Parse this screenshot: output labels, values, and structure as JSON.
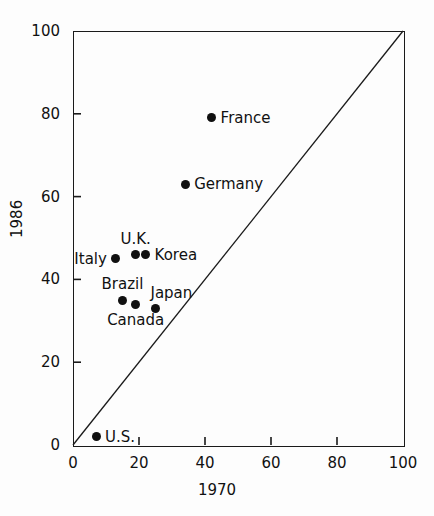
{
  "chart_data": {
    "type": "scatter",
    "title": "",
    "xlabel": "1970",
    "ylabel": "1986",
    "xlim": [
      0,
      100
    ],
    "ylim": [
      0,
      100
    ],
    "grid": false,
    "legend": "none",
    "xticks": [
      0,
      20,
      40,
      60,
      80,
      100
    ],
    "yticks": [
      0,
      20,
      40,
      60,
      80,
      100
    ],
    "xtick_labels": [
      "0",
      "20",
      "40",
      "60",
      "80",
      "100"
    ],
    "ytick_labels": [
      "0",
      "20",
      "40",
      "60",
      "80",
      "100"
    ],
    "annotations": [
      {
        "type": "line",
        "name": "identity-diagonal",
        "from": [
          0,
          0
        ],
        "to": [
          100,
          100
        ]
      }
    ],
    "points": [
      {
        "label": "France",
        "x": 42,
        "y": 79,
        "label_pos": "right"
      },
      {
        "label": "Germany",
        "x": 34,
        "y": 63,
        "label_pos": "right"
      },
      {
        "label": "U.K.",
        "x": 19,
        "y": 46,
        "label_pos": "above"
      },
      {
        "label": "Korea",
        "x": 22,
        "y": 46,
        "label_pos": "right"
      },
      {
        "label": "Italy",
        "x": 13,
        "y": 45,
        "label_pos": "left"
      },
      {
        "label": "Brazil",
        "x": 15,
        "y": 35,
        "label_pos": "above"
      },
      {
        "label": "Canada",
        "x": 19,
        "y": 34,
        "label_pos": "below"
      },
      {
        "label": "Japan",
        "x": 25,
        "y": 33,
        "label_pos": "aboveright"
      },
      {
        "label": "U.S.",
        "x": 7,
        "y": 2,
        "label_pos": "right"
      }
    ]
  },
  "colors": {
    "marker": "#101010",
    "axis": "#1a1a1a",
    "text": "#111111",
    "background": "#fdfdfd"
  }
}
